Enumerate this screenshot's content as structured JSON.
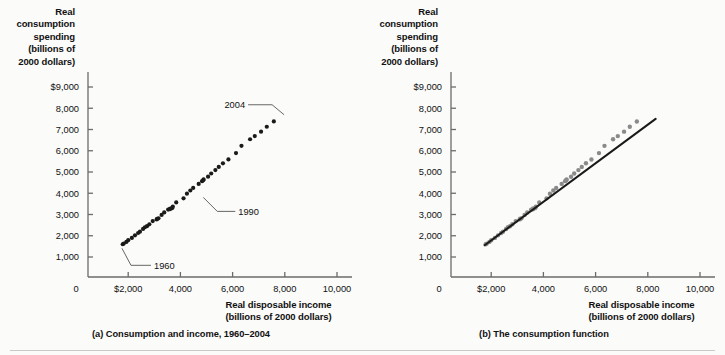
{
  "figure": {
    "background_color": "#fbfbfa",
    "point_color_a": "#1a1a1a",
    "point_color_b": "#8a8a8a",
    "line_color_b": "#1a1a1a",
    "axis_color": "#6b6b6b"
  },
  "panel_a": {
    "caption": "(a) Consumption and income, 1960–2004",
    "y_axis_title": "Real consumption spending (billions of 2000 dollars)",
    "y_axis_title_lines": [
      "Real",
      "consumption",
      "spending",
      "(billions of",
      "2000 dollars)"
    ],
    "x_axis_title_lines": [
      "Real disposable income",
      "(billions of 2000 dollars)"
    ],
    "y_ticks": [
      "$9,000",
      "8,000",
      "7,000",
      "6,000",
      "5,000",
      "4,000",
      "3,000",
      "2,000",
      "1,000"
    ],
    "x_ticks": [
      "0",
      "$2,000",
      "4,000",
      "6,000",
      "8,000",
      "10,000"
    ],
    "annotations": [
      {
        "label": "2004",
        "x": 8050,
        "y": 7600
      },
      {
        "label": "1990",
        "x": 4800,
        "y": 3900
      },
      {
        "label": "1960",
        "x": 1800,
        "y": 1550
      }
    ]
  },
  "panel_b": {
    "caption": "(b)  The consumption function",
    "y_axis_title": "Real consumption spending (billions of 2000 dollars)",
    "y_axis_title_lines": [
      "Real",
      "consumption",
      "spending",
      "(billions of",
      "2000 dollars)"
    ],
    "x_axis_title_lines": [
      "Real disposable income",
      "(billions of 2000 dollars)"
    ],
    "y_ticks": [
      "$9,000",
      "8,000",
      "7,000",
      "6,000",
      "5,000",
      "4,000",
      "3,000",
      "2,000",
      "1,000"
    ],
    "x_ticks": [
      "0",
      "$2,000",
      "4,000",
      "6,000",
      "8,000",
      "10,000"
    ],
    "trendline": {
      "x1": 1750,
      "y1": 1550,
      "x2": 8300,
      "y2": 7500
    }
  },
  "chart_data": {
    "type": "scatter",
    "xlabel": "Real disposable income (billions of 2000 dollars)",
    "ylabel": "Real consumption spending (billions of 2000 dollars)",
    "xlim": [
      0,
      10000
    ],
    "ylim": [
      0,
      9500
    ],
    "xticks": [
      0,
      2000,
      4000,
      6000,
      8000,
      10000
    ],
    "yticks": [
      1000,
      2000,
      3000,
      4000,
      5000,
      6000,
      7000,
      8000,
      9000
    ],
    "grid": false,
    "legend": null,
    "series": [
      {
        "name": "Consumption vs. disposable income, 1960-2004",
        "years": [
          1960,
          1961,
          1962,
          1963,
          1964,
          1965,
          1966,
          1967,
          1968,
          1969,
          1970,
          1971,
          1972,
          1973,
          1974,
          1975,
          1976,
          1977,
          1978,
          1979,
          1980,
          1981,
          1982,
          1983,
          1984,
          1985,
          1986,
          1987,
          1988,
          1989,
          1990,
          1991,
          1992,
          1993,
          1994,
          1995,
          1996,
          1997,
          1998,
          1999,
          2000,
          2001,
          2002,
          2003,
          2004
        ],
        "x": [
          1790,
          1830,
          1930,
          2000,
          2140,
          2260,
          2380,
          2450,
          2570,
          2640,
          2720,
          2810,
          2940,
          3110,
          3090,
          3160,
          3280,
          3380,
          3530,
          3610,
          3600,
          3680,
          3710,
          3840,
          4120,
          4250,
          4380,
          4490,
          4700,
          4830,
          4890,
          4870,
          5060,
          5180,
          5340,
          5470,
          5630,
          5840,
          6130,
          6340,
          6670,
          6850,
          7090,
          7310,
          7580
        ],
        "y": [
          1600,
          1630,
          1710,
          1790,
          1900,
          2020,
          2130,
          2190,
          2320,
          2400,
          2450,
          2540,
          2690,
          2800,
          2770,
          2820,
          2980,
          3100,
          3230,
          3280,
          3250,
          3300,
          3370,
          3570,
          3760,
          3980,
          4130,
          4250,
          4440,
          4570,
          4650,
          4610,
          4780,
          4930,
          5090,
          5240,
          5410,
          5590,
          5890,
          6230,
          6540,
          6690,
          6900,
          7130,
          7380
        ]
      }
    ]
  }
}
